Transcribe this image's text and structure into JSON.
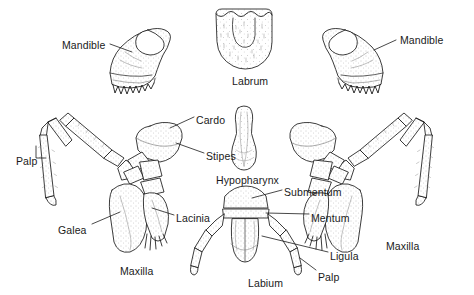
{
  "figure": {
    "background_color": "#ffffff",
    "ink_color": "#1a1a1a",
    "stipple_color": "#8c8c8c"
  },
  "labels": [
    {
      "id": "mandible-left",
      "text": "Mandible",
      "x": 62,
      "y": 39,
      "leader": true
    },
    {
      "id": "labrum",
      "text": "Labrum",
      "x": 232,
      "y": 75,
      "leader": false
    },
    {
      "id": "mandible-right",
      "text": "Mandible",
      "x": 400,
      "y": 34,
      "leader": true
    },
    {
      "id": "cardo",
      "text": "Cardo",
      "x": 196,
      "y": 114,
      "leader": true
    },
    {
      "id": "stipes",
      "text": "Stipes",
      "x": 206,
      "y": 150,
      "leader": true
    },
    {
      "id": "palp-left",
      "text": "Palp",
      "x": 16,
      "y": 155,
      "leader": true
    },
    {
      "id": "hypopharynx",
      "text": "Hypopharynx",
      "x": 216,
      "y": 174,
      "leader": false
    },
    {
      "id": "submentum",
      "text": "Submentum",
      "x": 284,
      "y": 186,
      "leader": true
    },
    {
      "id": "lacinia",
      "text": "Lacinia",
      "x": 176,
      "y": 212,
      "leader": true
    },
    {
      "id": "mentum",
      "text": "Mentum",
      "x": 311,
      "y": 212,
      "leader": true
    },
    {
      "id": "galea",
      "text": "Galea",
      "x": 58,
      "y": 224,
      "leader": true
    },
    {
      "id": "ligula",
      "text": "Ligula",
      "x": 330,
      "y": 250,
      "leader": true
    },
    {
      "id": "maxilla-left",
      "text": "Maxilla",
      "x": 120,
      "y": 265,
      "leader": false
    },
    {
      "id": "labium",
      "text": "Labium",
      "x": 248,
      "y": 277,
      "leader": false
    },
    {
      "id": "palp-right",
      "text": "Palp",
      "x": 318,
      "y": 271,
      "leader": true
    },
    {
      "id": "maxilla-right",
      "text": "Maxilla",
      "x": 386,
      "y": 240,
      "leader": false
    }
  ],
  "structures": [
    {
      "id": "mandible-left-drawing",
      "name": "left mandible"
    },
    {
      "id": "labrum-drawing",
      "name": "labrum"
    },
    {
      "id": "mandible-right-drawing",
      "name": "right mandible"
    },
    {
      "id": "maxilla-left-drawing",
      "name": "left maxilla"
    },
    {
      "id": "hypopharynx-drawing",
      "name": "hypopharynx"
    },
    {
      "id": "labium-drawing",
      "name": "labium"
    },
    {
      "id": "maxilla-right-drawing",
      "name": "right maxilla"
    }
  ]
}
